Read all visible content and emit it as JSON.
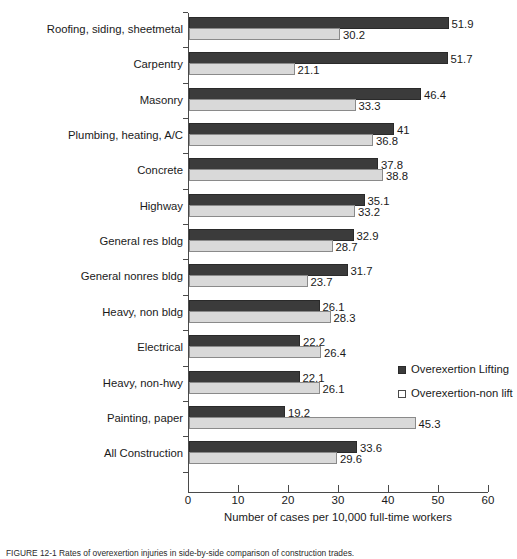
{
  "chart_data": {
    "type": "bar",
    "orientation": "horizontal",
    "title": "",
    "xlabel": "Number of cases per 10,000 full-time workers",
    "ylabel": "",
    "xlim": [
      0,
      60
    ],
    "xticks": [
      0,
      10,
      20,
      30,
      40,
      50,
      60
    ],
    "grid": false,
    "legend_position": "right-middle",
    "categories": [
      "Roofing, siding, sheetmetal",
      "Carpentry",
      "Masonry",
      "Plumbing, heating, A/C",
      "Concrete",
      "Highway",
      "General res bldg",
      "General nonres bldg",
      "Heavy, non bldg",
      "Electrical",
      "Heavy, non-hwy",
      "Painting, paper",
      "All Construction"
    ],
    "series": [
      {
        "name": "Overexertion Lifting",
        "color": "#3b3b3b",
        "values": [
          51.9,
          51.7,
          46.4,
          41,
          37.8,
          35.1,
          32.9,
          31.7,
          26.1,
          22.2,
          22.1,
          19.2,
          33.6
        ],
        "labels": [
          "51.9",
          "51.7",
          "46.4",
          "41",
          "37.8",
          "35.1",
          "32.9",
          "31.7",
          "26.1",
          "22.2",
          "22.1",
          "19.2",
          "33.6"
        ]
      },
      {
        "name": "Overexertion-non lift",
        "color": "#d9d9d9",
        "values": [
          30.2,
          21.1,
          33.3,
          36.8,
          38.8,
          33.2,
          28.7,
          23.7,
          28.3,
          26.4,
          26.1,
          45.3,
          29.6
        ],
        "labels": [
          "30.2",
          "21.1",
          "33.3",
          "36.8",
          "38.8",
          "33.2",
          "28.7",
          "23.7",
          "28.3",
          "26.4",
          "26.1",
          "45.3",
          "29.6"
        ]
      }
    ]
  },
  "legend": {
    "items": [
      {
        "label": "Overexertion Lifting",
        "swatch": "dark"
      },
      {
        "label": "Overexertion-non lift",
        "swatch": "light"
      }
    ]
  },
  "caption": {
    "text": "FIGURE 12-1   Rates of overexertion injuries in side-by-side comparison of construction trades."
  }
}
